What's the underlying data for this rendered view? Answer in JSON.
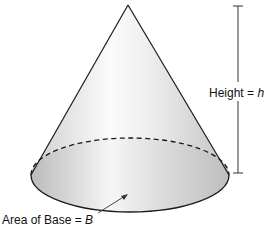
{
  "diagram": {
    "type": "cone",
    "colors": {
      "stroke": "#1a1a1a",
      "fill_light": "#f7f7f7",
      "fill_dark": "#c8c8c8"
    },
    "labels": {
      "height_text": "Height = ",
      "height_var": "h",
      "base_text": "Area of Base = ",
      "base_var": "B"
    }
  }
}
